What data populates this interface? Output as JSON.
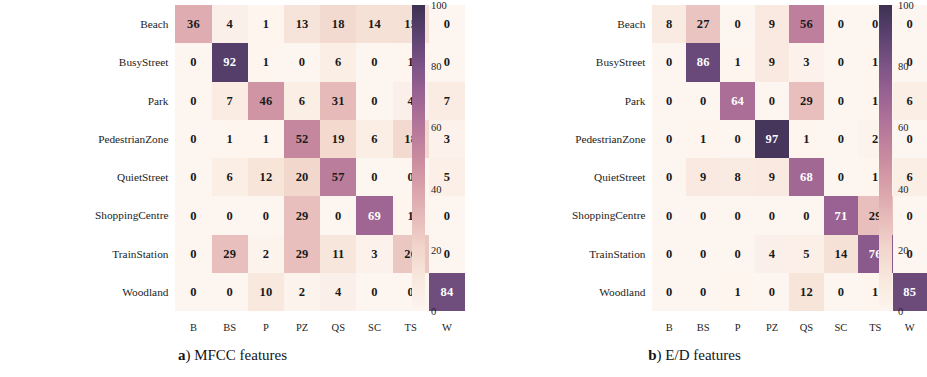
{
  "figure": {
    "colormap": {
      "name": "rocket-pink-purple",
      "stops": [
        {
          "v": 0,
          "hex": "#fdf6f0"
        },
        {
          "v": 10,
          "hex": "#f8e8de"
        },
        {
          "v": 20,
          "hex": "#f2d7cc"
        },
        {
          "v": 30,
          "hex": "#e7bcbb"
        },
        {
          "v": 40,
          "hex": "#d9a3ab"
        },
        {
          "v": 50,
          "hex": "#c98b9f"
        },
        {
          "v": 60,
          "hex": "#b5779a"
        },
        {
          "v": 70,
          "hex": "#9c6493"
        },
        {
          "v": 80,
          "hex": "#7d5486"
        },
        {
          "v": 90,
          "hex": "#5b4270"
        },
        {
          "v": 100,
          "hex": "#3d3152"
        }
      ]
    },
    "colorbar": {
      "ticks": [
        100,
        80,
        60,
        40,
        20,
        0
      ],
      "min": 0,
      "max": 100
    }
  },
  "chart_data": [
    {
      "type": "heatmap",
      "title": "(a) MFCC features",
      "caption_label": "a",
      "caption_text": "MFCC features",
      "xlabel": "",
      "ylabel": "",
      "zlim": [
        0,
        100
      ],
      "row_labels": [
        "Beach",
        "BusyStreet",
        "Park",
        "PedestrianZone",
        "QuietStreet",
        "ShoppingCentre",
        "TrainStation",
        "Woodland"
      ],
      "col_labels": [
        "B",
        "BS",
        "P",
        "PZ",
        "QS",
        "SC",
        "TS",
        "W"
      ],
      "values": [
        [
          36,
          4,
          1,
          13,
          18,
          14,
          15,
          0
        ],
        [
          0,
          92,
          1,
          0,
          6,
          0,
          1,
          0
        ],
        [
          0,
          7,
          46,
          6,
          31,
          0,
          4,
          7
        ],
        [
          0,
          1,
          1,
          52,
          19,
          6,
          18,
          3
        ],
        [
          0,
          6,
          12,
          20,
          57,
          0,
          0,
          5
        ],
        [
          0,
          0,
          0,
          29,
          0,
          69,
          1,
          0
        ],
        [
          0,
          29,
          2,
          29,
          11,
          3,
          26,
          0
        ],
        [
          0,
          0,
          10,
          2,
          4,
          0,
          0,
          84
        ]
      ]
    },
    {
      "type": "heatmap",
      "title": "(b) E/D features",
      "caption_label": "b",
      "caption_text": "E/D features",
      "xlabel": "",
      "ylabel": "",
      "zlim": [
        0,
        100
      ],
      "row_labels": [
        "Beach",
        "BusyStreet",
        "Park",
        "PedestrianZone",
        "QuietStreet",
        "ShoppingCentre",
        "TrainStation",
        "Woodland"
      ],
      "col_labels": [
        "B",
        "BS",
        "P",
        "PZ",
        "QS",
        "SC",
        "TS",
        "W"
      ],
      "values": [
        [
          8,
          27,
          0,
          9,
          56,
          0,
          0,
          0
        ],
        [
          0,
          86,
          1,
          9,
          3,
          0,
          1,
          0
        ],
        [
          0,
          0,
          64,
          0,
          29,
          0,
          1,
          6
        ],
        [
          0,
          1,
          0,
          97,
          1,
          0,
          2,
          0
        ],
        [
          0,
          9,
          8,
          9,
          68,
          0,
          1,
          6
        ],
        [
          0,
          0,
          0,
          0,
          0,
          71,
          29,
          0
        ],
        [
          0,
          0,
          0,
          4,
          5,
          14,
          76,
          0
        ],
        [
          0,
          0,
          1,
          0,
          12,
          0,
          1,
          85
        ]
      ]
    }
  ]
}
